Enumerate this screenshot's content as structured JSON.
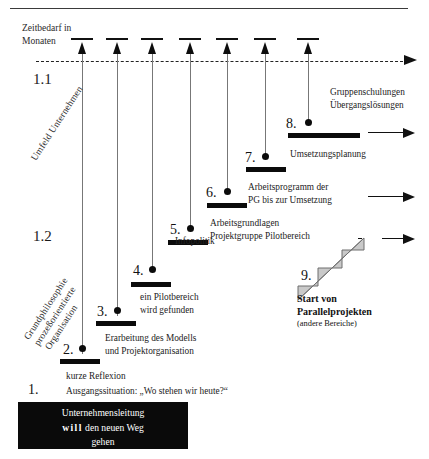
{
  "header": {
    "axis_label_line1": "Zeitbedarf in",
    "axis_label_line2": "Monaten"
  },
  "sections": [
    {
      "number": "1.1",
      "label_lines": [
        "Umfeld Unternehmen"
      ]
    },
    {
      "number": "1.2",
      "label_lines": [
        "Grundphilosophie",
        "prozeßorientierte",
        "Organisation"
      ]
    }
  ],
  "milestones": [
    {
      "number": "1.",
      "caption_lines": [
        "kurze Reflexion",
        "Ausgangssituation: „Wo stehen wir heute?“"
      ]
    },
    {
      "number": "2.",
      "caption_lines": []
    },
    {
      "number": "3.",
      "caption_lines": [
        "Erarbeitung des Modells",
        "und Projektorganisation"
      ]
    },
    {
      "number": "4.",
      "caption_lines": [
        "ein Pilotbereich",
        "wird gefunden"
      ]
    },
    {
      "number": "5.",
      "caption_lines": [
        "Infopolitik"
      ]
    },
    {
      "number": "6.",
      "caption_lines": [
        "Arbeitsgrundlagen",
        "Projektgruppe Pilotbereich"
      ]
    },
    {
      "number": "7.",
      "caption_lines": [
        "Arbeitsprogramm der",
        "PG bis zur Umsetzung"
      ]
    },
    {
      "number": "8.",
      "caption_lines": [
        "Umsetzungsplanung"
      ]
    },
    {
      "number": "9.",
      "caption_lines": [
        "Start von",
        "Parallelprojekten",
        "(andere Bereiche)"
      ]
    }
  ],
  "top_right_note": {
    "line1": "Gruppenschulungen",
    "line2": "Übergangslösungen"
  },
  "stairs_label": {
    "line1": "Start von",
    "line2": "Parallelprojekten",
    "line3": "(andere Bereiche)"
  },
  "bottom_box": {
    "line1": "Unternehmensleitung",
    "line2_pre": "will",
    "line2_post": " den neuen Weg",
    "line3": "gehen"
  },
  "colors": {
    "ink": "#0b0b0b",
    "stem": "#777777",
    "stairs_fill": "#c9c9c9",
    "stairs_stroke": "#7a7a7a",
    "background": "#ffffff"
  }
}
